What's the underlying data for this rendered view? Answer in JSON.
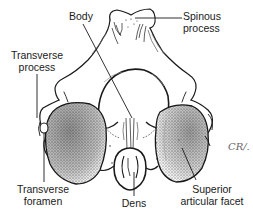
{
  "diagram": {
    "labels": {
      "body": "Body",
      "spinous_process_line1": "Spinous",
      "spinous_process_line2": "process",
      "transverse_process_line1": "Transverse",
      "transverse_process_line2": "process",
      "transverse_foramen_line1": "Transverse",
      "transverse_foramen_line2": "foramen",
      "dens": "Dens",
      "superior_articular_facet_line1": "Superior",
      "superior_articular_facet_line2": "articular facet"
    },
    "signature": "CR/.",
    "colors": {
      "ink": "#1a1a1a",
      "stipple": "#555555",
      "background": "#ffffff"
    }
  }
}
